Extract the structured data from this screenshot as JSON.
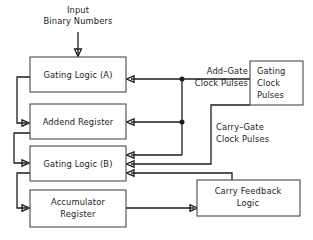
{
  "diagram": {
    "background_color": "#ffffff",
    "line_color": "#1c1c1c",
    "box_stroke_color": "#4a4a4a",
    "box_fill_color": "#ffffff",
    "input_label": {
      "line1": "Input",
      "line2": "Binary Numbers"
    },
    "boxes": [
      {
        "id": "gating-logic-a",
        "lines": [
          "Gating Logic (",
          "A",
          ")"
        ],
        "text_plain": "Gating Logic (A)",
        "prefix": "Gating Logic (",
        "italic": "A",
        "suffix": ")"
      },
      {
        "id": "addend-register",
        "text_plain": "Addend Register"
      },
      {
        "id": "gating-logic-b",
        "text_plain": "Gating Logic (B)",
        "prefix": "Gating Logic (",
        "italic": "B",
        "suffix": ")"
      },
      {
        "id": "accumulator-register",
        "line1": "Accumulator",
        "line2": "Register"
      },
      {
        "id": "gating-clock-pulses",
        "line1": "Gating",
        "line2": "Clock",
        "line3": "Pulses"
      },
      {
        "id": "carry-feedback-logic",
        "line1": "Carry Feedback",
        "line2": "Logic"
      }
    ],
    "wire_labels": {
      "add_gate": {
        "line1": "Add–Gate",
        "line2": "Clock Pulses"
      },
      "carry_gate": {
        "line1": "Carry–Gate",
        "line2": "Clock  Pulses"
      }
    }
  }
}
